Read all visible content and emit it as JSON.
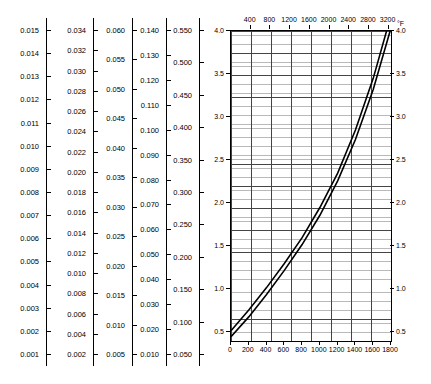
{
  "chart_data": {
    "type": "line",
    "title": "",
    "xlabel": "",
    "ylabel": "",
    "xlim": [
      0,
      1800
    ],
    "ylim": [
      0.4,
      4.0
    ],
    "x_ticks": [
      0,
      200,
      400,
      600,
      800,
      1000,
      1200,
      1400,
      1600,
      1800
    ],
    "y_ticks": [
      0.5,
      1.0,
      1.5,
      2.0,
      2.5,
      3.0,
      3.5,
      4.0
    ],
    "y_ticks_right": [
      0.5,
      1.0,
      1.5,
      2.0,
      2.5,
      3.0,
      3.5,
      4.0
    ],
    "top_axis_label": "°F",
    "top_ticks": [
      400,
      800,
      1200,
      1600,
      2000,
      2400,
      2800,
      3200
    ],
    "unit_note": "Ω · mm² / m",
    "grid": true,
    "legend": "none",
    "series": [
      {
        "name": "upper",
        "x": [
          0,
          200,
          400,
          600,
          800,
          1000,
          1200,
          1400,
          1600,
          1750
        ],
        "y": [
          0.52,
          0.76,
          1.02,
          1.3,
          1.6,
          1.95,
          2.35,
          2.85,
          3.45,
          4.0
        ]
      },
      {
        "name": "lower",
        "x": [
          0,
          200,
          400,
          600,
          800,
          1000,
          1200,
          1400,
          1600,
          1790
        ],
        "y": [
          0.45,
          0.68,
          0.94,
          1.22,
          1.52,
          1.86,
          2.26,
          2.74,
          3.32,
          4.0
        ]
      }
    ]
  },
  "side_axes": [
    {
      "name": "axis-1",
      "labels": [
        "0.015",
        "0.014",
        "0.013",
        "0.012",
        "0.011",
        "0.010",
        "0.009",
        "0.008",
        "0.007",
        "0.006",
        "0.005",
        "0.004",
        "0.003",
        "0.002",
        "0.001"
      ]
    },
    {
      "name": "axis-2",
      "labels": [
        "0.034",
        "0.032",
        "0.030",
        "0.028",
        "0.026",
        "0.024",
        "0.022",
        "0.020",
        "0.018",
        "0.016",
        "0.014",
        "0.012",
        "0.010",
        "0.008",
        "0.006",
        "0.004",
        "0.002"
      ]
    },
    {
      "name": "axis-3",
      "labels": [
        "0.060",
        "0.055",
        "0.050",
        "0.045",
        "0.040",
        "0.035",
        "0.030",
        "0.025",
        "0.020",
        "0.015",
        "0.010",
        "0.005"
      ]
    },
    {
      "name": "axis-4",
      "labels": [
        "0.140",
        "0.130",
        "0.120",
        "0.110",
        "0.100",
        "0.090",
        "0.080",
        "0.070",
        "0.060",
        "0.050",
        "0.040",
        "0.030",
        "0.020",
        "0.010"
      ]
    },
    {
      "name": "axis-5",
      "labels": [
        "0.550",
        "0.500",
        "0.450",
        "0.400",
        "0.350",
        "0.300",
        "0.250",
        "0.200",
        "0.150",
        "0.100",
        "0.050"
      ]
    }
  ]
}
